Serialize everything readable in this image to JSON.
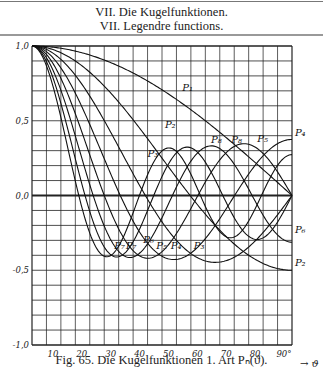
{
  "header": {
    "line1": "VII. Die Kugelfunktionen.",
    "line2": "VII. Legendre functions."
  },
  "caption": "Fig. 65. Die Kugelfunktionen 1. Art Pₙ(ϑ).",
  "chart_data": {
    "type": "line",
    "xlabel": "ϑ",
    "ylabel": "",
    "xlim": [
      0,
      90
    ],
    "ylim": [
      -1.0,
      1.0
    ],
    "grid": true,
    "x_grid_step": 5,
    "y_grid_step": 0.1,
    "x_ticks": [
      10,
      20,
      30,
      40,
      50,
      60,
      70,
      80,
      90
    ],
    "x_tick_labels": [
      "10",
      "20",
      "30",
      "40",
      "50",
      "60",
      "70",
      "80",
      "90°"
    ],
    "y_ticks": [
      1.0,
      0.5,
      0.0,
      -0.5,
      -1.0
    ],
    "y_tick_labels": [
      "1,0",
      "0,5",
      "0,0",
      "-0,5",
      "-1,0"
    ],
    "function": "P_n(cos ϑ), Legendre polynomials of the first kind",
    "series": [
      {
        "name": "P1",
        "n": 1,
        "label": "P₁"
      },
      {
        "name": "P2",
        "n": 2,
        "label": "P₂"
      },
      {
        "name": "P3",
        "n": 3,
        "label": "P₃"
      },
      {
        "name": "P4",
        "n": 4,
        "label": "P₄"
      },
      {
        "name": "P5",
        "n": 5,
        "label": "P₅"
      },
      {
        "name": "P6",
        "n": 6,
        "label": "P₆"
      },
      {
        "name": "P7",
        "n": 7,
        "label": "P₇"
      },
      {
        "name": "P8",
        "n": 8,
        "label": "P₈"
      }
    ],
    "sample_values": {
      "x": [
        0,
        10,
        20,
        30,
        40,
        50,
        60,
        70,
        80,
        90
      ],
      "P1": [
        1.0,
        0.985,
        0.94,
        0.866,
        0.766,
        0.643,
        0.5,
        0.342,
        0.174,
        0.0
      ],
      "P2": [
        1.0,
        0.955,
        0.825,
        0.625,
        0.38,
        0.12,
        -0.125,
        -0.325,
        -0.455,
        -0.5
      ],
      "P3": [
        1.0,
        0.911,
        0.665,
        0.325,
        -0.025,
        -0.295,
        -0.438,
        -0.413,
        -0.247,
        0.0
      ],
      "P4": [
        1.0,
        0.853,
        0.463,
        0.023,
        -0.3,
        -0.406,
        -0.289,
        -0.039,
        0.241,
        0.375
      ],
      "P5": [
        1.0,
        0.784,
        0.236,
        -0.289,
        -0.42,
        -0.191,
        0.09,
        0.3,
        0.271,
        0.0
      ],
      "P6": [
        1.0,
        0.704,
        0.012,
        -0.409,
        -0.234,
        0.147,
        0.323,
        0.114,
        -0.192,
        -0.313
      ],
      "P7": [
        1.0,
        0.615,
        -0.194,
        -0.364,
        0.045,
        0.339,
        0.223,
        -0.196,
        -0.255,
        0.0
      ],
      "P8": [
        1.0,
        0.52,
        -0.356,
        -0.248,
        0.266,
        0.239,
        -0.073,
        -0.265,
        0.105,
        0.273
      ]
    },
    "annotations": [
      {
        "text": "P₁",
        "series": "P1"
      },
      {
        "text": "P₂",
        "series": "P2"
      },
      {
        "text": "P₃",
        "series": "P3"
      },
      {
        "text": "P₄",
        "series": "P4"
      },
      {
        "text": "P₅",
        "series": "P5"
      },
      {
        "text": "P₆",
        "series": "P6"
      },
      {
        "text": "P₇",
        "series": "P7"
      },
      {
        "text": "P₈",
        "series": "P8"
      },
      {
        "text": "P₃",
        "series": "P3"
      },
      {
        "text": "P₄",
        "series": "P4"
      },
      {
        "text": "P₅",
        "series": "P5"
      },
      {
        "text": "P₆",
        "series": "P6"
      },
      {
        "text": "P₇",
        "series": "P7"
      },
      {
        "text": "P₈",
        "series": "P8"
      },
      {
        "text": "P₂",
        "series": "P2"
      }
    ],
    "axis_arrow": "→ ϑ"
  }
}
